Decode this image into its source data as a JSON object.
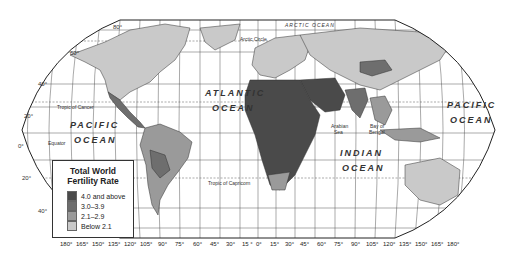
{
  "legend": {
    "title_line1": "Total World",
    "title_line2": "Fertility Rate",
    "items": [
      {
        "label": "4.0 and above",
        "color": "#4a4a4a"
      },
      {
        "label": "3.0–3.9",
        "color": "#6e6e6e"
      },
      {
        "label": "2.1–2.9",
        "color": "#9a9a9a"
      },
      {
        "label": "Below 2.1",
        "color": "#c9c9c9"
      }
    ]
  },
  "oceans": {
    "atlantic_1": "ATLANTIC",
    "atlantic_2": "OCEAN",
    "pacific_w_1": "PACIFIC",
    "pacific_w_2": "OCEAN",
    "pacific_e_1": "PACIFIC",
    "pacific_e_2": "OCEAN",
    "indian_1": "INDIAN",
    "indian_2": "OCEAN",
    "arctic": "ARCTIC OCEAN"
  },
  "features": {
    "arctic_circle": "Arctic Circle",
    "tropic_cancer": "Tropic of Cancer",
    "tropic_capricorn": "Tropic of Capricorn",
    "equator": "Equator",
    "arabian_sea_1": "Arabian",
    "arabian_sea_2": "Sea",
    "bay_bengal_1": "Bay of",
    "bay_bengal_2": "Bengal"
  },
  "latitudes": {
    "l80": "80°",
    "l60": "60°",
    "l40n": "40°",
    "l20n": "20°",
    "l0": "0°",
    "l20s": "20°",
    "l40s": "40°"
  },
  "longitudes": [
    "180°",
    "165°",
    "150°",
    "135°",
    "120°",
    "105°",
    "90°",
    "75°",
    "60°",
    "45°",
    "30°",
    "15 °",
    "0°",
    "15°",
    "30°",
    "45°",
    "60°",
    "75°",
    "90°",
    "105°",
    "120°",
    "135°",
    "150°",
    "165°",
    "180°"
  ]
}
